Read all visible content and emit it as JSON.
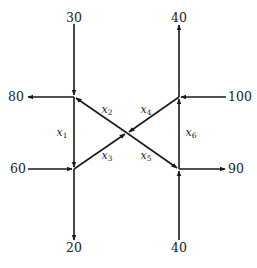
{
  "diagram": {
    "type": "traffic-flow-network",
    "nodes": [
      {
        "id": "A",
        "position": "top-left"
      },
      {
        "id": "B",
        "position": "top-right"
      },
      {
        "id": "C",
        "position": "bottom-left"
      },
      {
        "id": "D",
        "position": "bottom-right"
      },
      {
        "id": "E",
        "position": "center"
      }
    ],
    "external_flows": [
      {
        "id": "in-top-left",
        "label": "30",
        "node": "A",
        "direction": "in"
      },
      {
        "id": "out-left-top",
        "label": "80",
        "node": "A",
        "direction": "out"
      },
      {
        "id": "out-top-right",
        "label": "40",
        "node": "B",
        "direction": "out"
      },
      {
        "id": "in-right-top",
        "label": "100",
        "node": "B",
        "direction": "in"
      },
      {
        "id": "in-left-bottom",
        "label": "60",
        "node": "C",
        "direction": "in"
      },
      {
        "id": "out-bottom-left",
        "label": "20",
        "node": "C",
        "direction": "out"
      },
      {
        "id": "out-right-bottom",
        "label": "90",
        "node": "D",
        "direction": "out"
      },
      {
        "id": "in-bottom-right",
        "label": "40",
        "node": "D",
        "direction": "in"
      }
    ],
    "internal_flows": [
      {
        "id": "x1",
        "var": "x",
        "sub": "1",
        "from": "A",
        "to": "C"
      },
      {
        "id": "x2",
        "var": "x",
        "sub": "2",
        "from": "E",
        "to": "A"
      },
      {
        "id": "x3",
        "var": "x",
        "sub": "3",
        "from": "C",
        "to": "E"
      },
      {
        "id": "x4",
        "var": "x",
        "sub": "4",
        "from": "B",
        "to": "E"
      },
      {
        "id": "x5",
        "var": "x",
        "sub": "5",
        "from": "E",
        "to": "D"
      },
      {
        "id": "x6",
        "var": "x",
        "sub": "6",
        "from": "D",
        "to": "B"
      }
    ]
  }
}
